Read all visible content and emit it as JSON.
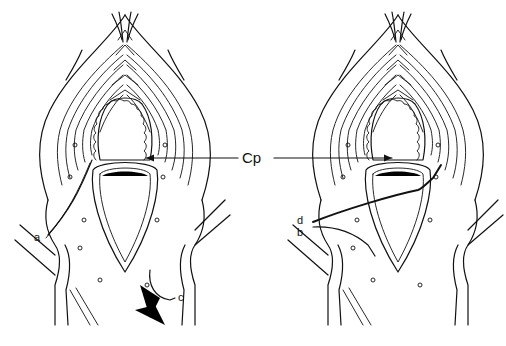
{
  "figure": {
    "type": "anatomical line drawing",
    "panels": [
      {
        "id": "left",
        "labels": [
          "a",
          "c"
        ]
      },
      {
        "id": "right",
        "labels": [
          "d",
          "b"
        ]
      }
    ],
    "center_label": "Cp",
    "labels": {
      "a": "a",
      "b": "b",
      "c": "c",
      "d": "d",
      "cp": "Cp"
    },
    "colors": {
      "ink": "#111111",
      "background": "#ffffff"
    }
  }
}
